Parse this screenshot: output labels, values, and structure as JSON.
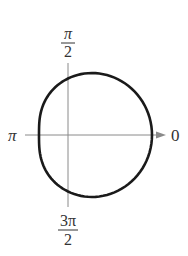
{
  "chart_data": {
    "type": "line",
    "subtype": "polar",
    "title": "",
    "curve": {
      "form": "limacon r = a + b*cos(theta)",
      "a": 56.5,
      "b": 27.5,
      "color": "#1a1a1a"
    },
    "angle_labels": {
      "right": "0",
      "top_numerator": "π",
      "top_denominator": "2",
      "left": "π",
      "bottom_numerator": "3π",
      "bottom_denominator": "2"
    },
    "grid": false,
    "axis_color": "#8a8a8a"
  }
}
